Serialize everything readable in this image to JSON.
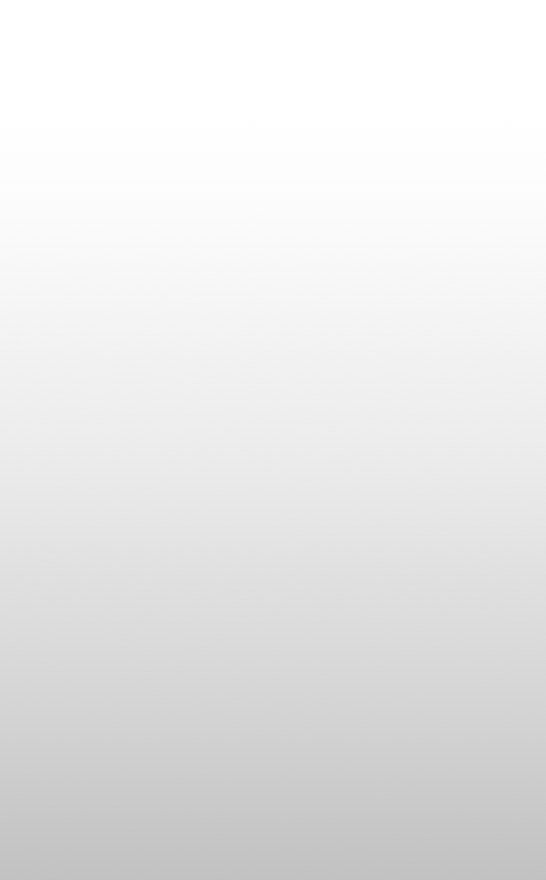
{
  "surface": {
    "width": 546,
    "height": 880,
    "orientation": "portrait",
    "content": "none",
    "description": "Blank surface with a smooth top-to-bottom white-to-grey gradient. No text, icons, controls or structural edges are present at any magnification.",
    "gradient": {
      "type": "linear",
      "direction": "to bottom",
      "stops": [
        {
          "offset": "0%",
          "color": "#ffffff"
        },
        {
          "offset": "12%",
          "color": "#ffffff"
        },
        {
          "offset": "20%",
          "color": "#fdfdfd"
        },
        {
          "offset": "26%",
          "color": "#fafafa"
        },
        {
          "offset": "34%",
          "color": "#f6f6f6"
        },
        {
          "offset": "42%",
          "color": "#f1f1f1"
        },
        {
          "offset": "50%",
          "color": "#ededed"
        },
        {
          "offset": "58%",
          "color": "#e7e7e7"
        },
        {
          "offset": "66%",
          "color": "#e0e0e0"
        },
        {
          "offset": "74%",
          "color": "#dadada"
        },
        {
          "offset": "82%",
          "color": "#d3d3d3"
        },
        {
          "offset": "90%",
          "color": "#cbcbcb"
        },
        {
          "offset": "96%",
          "color": "#c5c5c5"
        },
        {
          "offset": "100%",
          "color": "#c2c2c2"
        }
      ]
    },
    "sampled_colors": [
      {
        "y": 20,
        "hex": "#ffffff"
      },
      {
        "y": 230,
        "hex": "#fafafa"
      },
      {
        "y": 440,
        "hex": "#efefef"
      },
      {
        "y": 650,
        "hex": "#dcdcdc"
      },
      {
        "y": 865,
        "hex": "#c2c2c2"
      }
    ],
    "artifacts": {
      "banding": "faint horizontal quantisation steps across the mid-gradient",
      "noise": "low-amplitude block-compression mottling, most visible below the midpoint"
    }
  }
}
